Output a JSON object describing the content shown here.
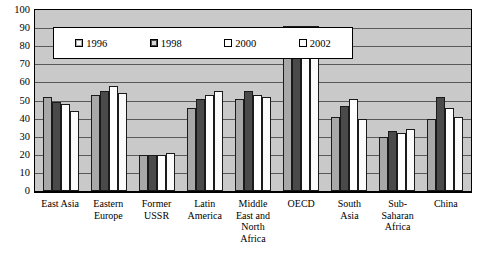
{
  "chart_data": {
    "type": "bar",
    "title": "",
    "xlabel": "",
    "ylabel": "",
    "ylim": [
      0,
      100
    ],
    "yticks": [
      100,
      90,
      80,
      70,
      60,
      50,
      40,
      30,
      20,
      10,
      0
    ],
    "grid": true,
    "legend_position": "top-left-inside",
    "categories": [
      "East Asia",
      "Eastern Europe",
      "Former USSR",
      "Latin America",
      "Middle East and North Africa",
      "OECD",
      "South Asia",
      "Sub-Saharan Africa",
      "China"
    ],
    "category_lines": [
      [
        "East Asia"
      ],
      [
        "Eastern",
        "Europe"
      ],
      [
        "Former",
        "USSR"
      ],
      [
        "Latin",
        "America"
      ],
      [
        "Middle",
        "East and",
        "North",
        "Africa"
      ],
      [
        "OECD"
      ],
      [
        "South",
        "Asia"
      ],
      [
        "Sub-",
        "Saharan",
        "Africa"
      ],
      [
        "China"
      ]
    ],
    "series": [
      {
        "name": "1996",
        "color": "#a8a8a8",
        "values": [
          52,
          53,
          20,
          46,
          51,
          91,
          41,
          30,
          40
        ]
      },
      {
        "name": "1998",
        "color": "#4a4a4a",
        "values": [
          49,
          55,
          20,
          51,
          55,
          91,
          47,
          33,
          52
        ]
      },
      {
        "name": "2000",
        "color": "#ffffff",
        "values": [
          48,
          58,
          20,
          53,
          53,
          91,
          51,
          32,
          46
        ]
      },
      {
        "name": "2002",
        "color": "#fbfbfb",
        "values": [
          44,
          54,
          21,
          55,
          52,
          91,
          40,
          34,
          41
        ]
      }
    ]
  },
  "legend": {
    "items": [
      {
        "label": "1996"
      },
      {
        "label": "1998"
      },
      {
        "label": "2000"
      },
      {
        "label": "2002"
      }
    ]
  }
}
